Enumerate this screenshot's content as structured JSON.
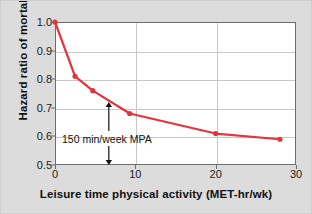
{
  "chart_data": {
    "type": "line",
    "title": "",
    "xlabel": "Leisure time physical activity (MET-hr/wk)",
    "ylabel": "Hazard ratio of mortality",
    "xlim": [
      0,
      30
    ],
    "ylim": [
      0.5,
      1.0
    ],
    "xticks": [
      "0",
      "10",
      "20",
      "30"
    ],
    "xtick_values": [
      0,
      10,
      20,
      30
    ],
    "yticks": [
      "0.5",
      "0.6",
      "0.7",
      "0.8",
      "0.9",
      "1.0"
    ],
    "ytick_values": [
      0.5,
      0.6,
      0.7,
      0.8,
      0.9,
      1.0
    ],
    "grid": "both",
    "legend": "none",
    "series": [
      {
        "name": "Hazard ratio of mortality",
        "color": "#e6333a",
        "marker": "circle",
        "x": [
          0,
          2.5,
          4.7,
          9.3,
          20,
          28
        ],
        "values": [
          1.0,
          0.81,
          0.76,
          0.68,
          0.61,
          0.59
        ]
      }
    ],
    "annotations": [
      {
        "text": "150 min/week MPA",
        "x": 6.7,
        "y_top": 0.72,
        "y_bottom": 0.5,
        "arrow": "double-headed-vertical",
        "color": "#111111"
      }
    ]
  },
  "colors": {
    "background": "#dcdcdc",
    "plot_background": "#ffffff",
    "axis": "#6d6d6d",
    "gridline": "#c8c8c8",
    "series": "#e6333a",
    "text": "#111111"
  }
}
